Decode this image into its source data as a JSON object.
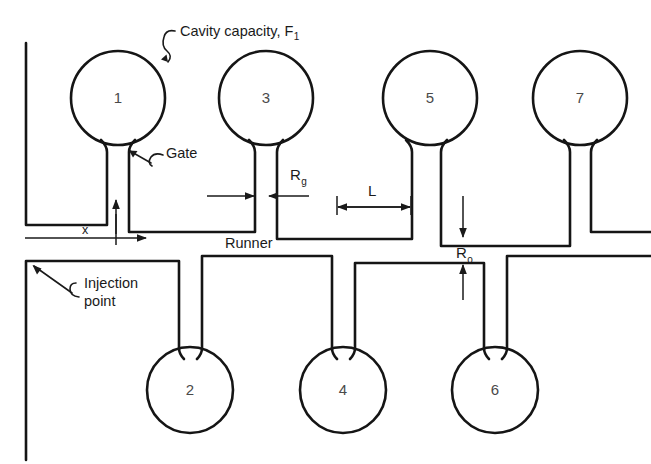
{
  "figure": {
    "title_annotation": "Cavity capacity, F",
    "title_annotation_sub": "1",
    "gate_label": "Gate",
    "runner_label": "Runner",
    "injection_label_line1": "Injection",
    "injection_label_line2": "point",
    "distance_label": "x",
    "dimensions": [
      {
        "name": "gate-radius",
        "symbol": "R",
        "subscript": "g"
      },
      {
        "name": "runner-segment-length",
        "symbol": "L",
        "subscript": ""
      },
      {
        "name": "runner-radius-top",
        "symbol": "R",
        "subscript": "o"
      },
      {
        "name": "runner-radius-bottom",
        "symbol": "R",
        "subscript": "o"
      }
    ],
    "cavities_top": [
      {
        "number": "1",
        "cx": 118,
        "cy": 98,
        "r": 47
      },
      {
        "number": "3",
        "cx": 266,
        "cy": 98,
        "r": 47
      },
      {
        "number": "5",
        "cx": 430,
        "cy": 98,
        "r": 47
      },
      {
        "number": "7",
        "cx": 580,
        "cy": 98,
        "r": 47
      }
    ],
    "cavities_bottom": [
      {
        "number": "2",
        "cx": 190,
        "cy": 390,
        "r": 43
      },
      {
        "number": "4",
        "cx": 343,
        "cy": 390,
        "r": 43
      },
      {
        "number": "6",
        "cx": 495,
        "cy": 390,
        "r": 43
      }
    ],
    "colors": {
      "line": "#151515",
      "text": "#1a1a1a",
      "cavity_number": "#4a4a4a",
      "background": "#ffffff"
    }
  }
}
